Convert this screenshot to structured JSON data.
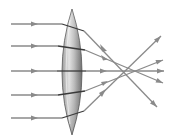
{
  "diagram": {
    "type": "converging-lens-ray-diagram",
    "colors": {
      "background": "#ffffff",
      "ray": "#8a8a8a",
      "ray_inside_lens": "#3a3a3a",
      "lens_light": "#d8d8d8",
      "lens_dark": "#7a7a7a",
      "lens_outline": "#555555"
    },
    "lens": {
      "center_x": 72,
      "top_y": 9,
      "bottom_y": 135,
      "half_width": 14
    },
    "focal_point": {
      "x": 125,
      "y": 71
    },
    "rays": [
      {
        "y": 24,
        "enter_x": 62,
        "exit_x": 84,
        "exit_y": 31,
        "end_x": 157,
        "end_y": 107
      },
      {
        "y": 46,
        "enter_x": 58,
        "exit_x": 85,
        "exit_y": 50,
        "end_x": 163,
        "end_y": 83
      },
      {
        "y": 71,
        "enter_x": 57,
        "exit_x": 86,
        "exit_y": 71,
        "end_x": 164,
        "end_y": 71
      },
      {
        "y": 95,
        "enter_x": 58,
        "exit_x": 85,
        "exit_y": 91,
        "end_x": 163,
        "end_y": 60
      },
      {
        "y": 118,
        "enter_x": 62,
        "exit_x": 84,
        "exit_y": 111,
        "end_x": 161,
        "end_y": 36
      }
    ],
    "incoming_arrow_x": 35,
    "ray_start_x": 11
  }
}
